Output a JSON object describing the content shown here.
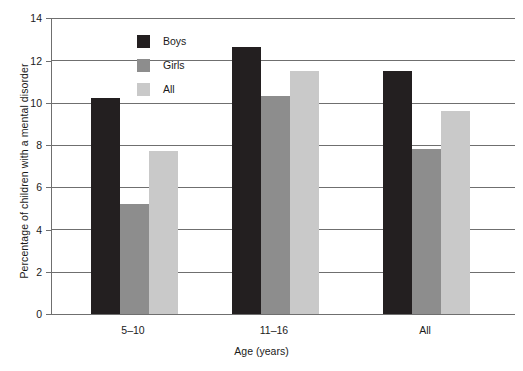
{
  "chart_data": {
    "type": "bar",
    "title": "",
    "xlabel": "Age (years)",
    "ylabel": "Percentage of children with a mental disorder",
    "categories": [
      "5–10",
      "11–16",
      "All"
    ],
    "series": [
      {
        "name": "Boys",
        "color": "#231f20",
        "values": [
          10.2,
          12.65,
          11.5
        ]
      },
      {
        "name": "Girls",
        "color": "#8d8d8d",
        "values": [
          5.2,
          10.3,
          7.8
        ]
      },
      {
        "name": "All",
        "color": "#c9c9c9",
        "values": [
          7.7,
          11.5,
          9.6
        ]
      }
    ],
    "ylim": [
      0,
      14
    ],
    "yticks": [
      0,
      2,
      4,
      6,
      8,
      10,
      12,
      14
    ],
    "ytick_labels": [
      "0",
      "2",
      "4",
      "6",
      "8",
      "10",
      "12",
      "14"
    ],
    "grid": true,
    "legend_position": "top-left-inside"
  },
  "yticks": {
    "t0": "0",
    "t1": "2",
    "t2": "4",
    "t3": "6",
    "t4": "8",
    "t5": "10",
    "t6": "12",
    "t7": "14"
  },
  "xticks": {
    "g0": "5–10",
    "g1": "11–16",
    "g2": "All"
  },
  "axis": {
    "x_title": "Age (years)",
    "y_title": "Percentage of children with a mental disorder"
  },
  "legend": {
    "items": [
      {
        "label": "Boys",
        "color": "#231f20"
      },
      {
        "label": "Girls",
        "color": "#8d8d8d"
      },
      {
        "label": "All",
        "color": "#c9c9c9"
      }
    ]
  }
}
